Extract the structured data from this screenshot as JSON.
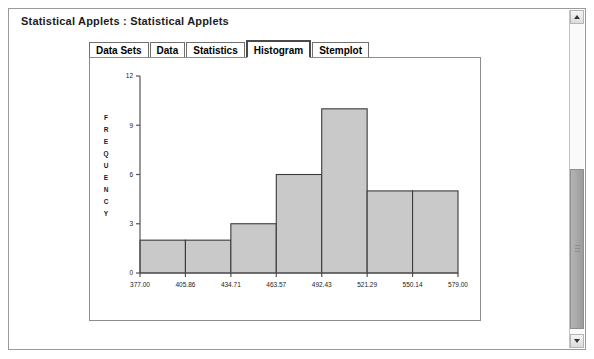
{
  "window": {
    "title": "Statistical Applets : Statistical Applets"
  },
  "tabs": [
    {
      "label": "Data Sets",
      "selected": false
    },
    {
      "label": "Data",
      "selected": false
    },
    {
      "label": "Statistics",
      "selected": false
    },
    {
      "label": "Histogram",
      "selected": true
    },
    {
      "label": "Stemplot",
      "selected": false
    }
  ],
  "scrollbar": {
    "up_arrow": "scroll-up",
    "down_arrow": "scroll-down"
  },
  "chart_data": {
    "type": "bar",
    "title": "",
    "xlabel": "",
    "ylabel": "FREQUENCY",
    "ylabel_letters": [
      "F",
      "R",
      "E",
      "Q",
      "U",
      "E",
      "N",
      "C",
      "Y"
    ],
    "categories": [
      "377.00-405.86",
      "405.86-434.71",
      "434.71-463.57",
      "463.57-492.43",
      "492.43-521.29",
      "521.29-550.14",
      "550.14-579.00"
    ],
    "bin_edges": [
      377.0,
      405.86,
      434.71,
      463.57,
      492.43,
      521.29,
      550.14,
      579.0
    ],
    "values": [
      2,
      2,
      3,
      6,
      10,
      5,
      5
    ],
    "xtick_labels": [
      "377.00",
      "405.86",
      "434.71",
      "463.57",
      "492.43",
      "521.29",
      "550.14",
      "579.00"
    ],
    "ytick_labels": [
      "0",
      "3",
      "6",
      "9",
      "12"
    ],
    "yticks": [
      0,
      3,
      6,
      9,
      12
    ],
    "ylim": [
      0,
      12
    ],
    "xlim": [
      377.0,
      579.0
    ],
    "grid": false,
    "legend": null,
    "bar_fill": "#c9c9c9",
    "bar_stroke": "#3a3a3a"
  }
}
